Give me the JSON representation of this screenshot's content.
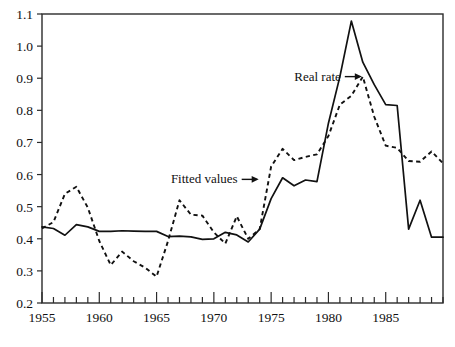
{
  "chart_data": {
    "type": "line",
    "title": "",
    "subtitle": "",
    "xlabel": "",
    "ylabel": "",
    "xlim": [
      1955,
      1990
    ],
    "ylim": [
      0.2,
      1.1
    ],
    "grid": false,
    "legend_position": "inline-annotations",
    "y_ticks": [
      "1.1",
      "1.0",
      "0.9",
      "0.8",
      "0.7",
      "0.6",
      "0.5",
      "0.4",
      "0.3",
      "0.2"
    ],
    "y_tick_values": [
      1.1,
      1.0,
      0.9,
      0.8,
      0.7,
      0.6,
      0.5,
      0.4,
      0.3,
      0.2
    ],
    "x_ticks": [
      "1955",
      "1960",
      "1965",
      "1970",
      "1975",
      "1980",
      "1985"
    ],
    "x_tick_values": [
      1955,
      1960,
      1965,
      1970,
      1975,
      1980,
      1985
    ],
    "x_minor_tick_values": [
      1956,
      1957,
      1958,
      1959,
      1961,
      1962,
      1963,
      1964,
      1966,
      1967,
      1968,
      1969,
      1971,
      1972,
      1973,
      1974,
      1976,
      1977,
      1978,
      1979,
      1981,
      1982,
      1983,
      1984,
      1986,
      1987,
      1988,
      1989,
      1990
    ],
    "x": [
      1955,
      1956,
      1957,
      1958,
      1959,
      1960,
      1961,
      1962,
      1963,
      1964,
      1965,
      1966,
      1967,
      1968,
      1969,
      1970,
      1971,
      1972,
      1973,
      1974,
      1975,
      1976,
      1977,
      1978,
      1979,
      1980,
      1981,
      1982,
      1983,
      1984,
      1985,
      1986,
      1987,
      1988,
      1989,
      1990
    ],
    "series": [
      {
        "name": "Real rate",
        "style": "solid",
        "color": "#111111",
        "values": [
          0.437,
          0.432,
          0.411,
          0.444,
          0.437,
          0.423,
          0.423,
          0.425,
          0.424,
          0.423,
          0.423,
          0.407,
          0.408,
          0.406,
          0.398,
          0.4,
          0.42,
          0.412,
          0.39,
          0.43,
          0.525,
          0.59,
          0.565,
          0.583,
          0.578,
          0.76,
          0.905,
          1.078,
          0.95,
          0.88,
          0.818,
          0.815,
          0.43,
          0.52,
          0.405,
          0.405
        ]
      },
      {
        "name": "Fitted values",
        "style": "dashed",
        "color": "#111111",
        "values": [
          0.432,
          0.452,
          0.54,
          0.562,
          0.497,
          0.393,
          0.318,
          0.36,
          0.33,
          0.31,
          0.282,
          0.393,
          0.52,
          0.475,
          0.472,
          0.42,
          0.385,
          0.47,
          0.4,
          0.43,
          0.625,
          0.68,
          0.645,
          0.655,
          0.663,
          0.72,
          0.818,
          0.845,
          0.905,
          0.78,
          0.69,
          0.683,
          0.642,
          0.64,
          0.672,
          0.635
        ]
      }
    ],
    "annotations": [
      {
        "text": "Real rate",
        "target_series": "Real rate",
        "label_x": 1983,
        "label_y": 0.905
      },
      {
        "text": "Fitted values",
        "target_series": "Fitted values",
        "label_x": 1974,
        "label_y": 0.585
      }
    ]
  },
  "axes": {
    "y_axis_name": "y-axis",
    "x_axis_name": "x-axis"
  }
}
